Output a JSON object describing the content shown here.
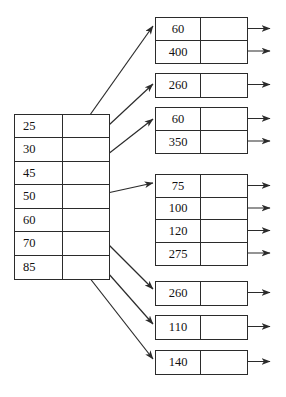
{
  "diagram": {
    "stroke_color": "#2b2b2b",
    "text_color": "#111111",
    "background": "#ffffff"
  },
  "index_table": {
    "name": "index-table",
    "geometry": {
      "x": 14,
      "y": 114,
      "width": 96,
      "height": 166,
      "divider_x": 48
    },
    "rows": [
      {
        "key": "25",
        "pointer": ""
      },
      {
        "key": "30",
        "pointer": ""
      },
      {
        "key": "45",
        "pointer": ""
      },
      {
        "key": "50",
        "pointer": ""
      },
      {
        "key": "60",
        "pointer": ""
      },
      {
        "key": "70",
        "pointer": ""
      },
      {
        "key": "85",
        "pointer": ""
      }
    ]
  },
  "buckets": [
    {
      "id": "bucket-1",
      "x": 155,
      "y": 17,
      "width": 93,
      "row_height": 22.5,
      "entries": [
        "60",
        "400"
      ]
    },
    {
      "id": "bucket-2",
      "x": 155,
      "y": 73,
      "width": 93,
      "row_height": 23,
      "entries": [
        "260"
      ]
    },
    {
      "id": "bucket-3",
      "x": 155,
      "y": 107,
      "width": 93,
      "row_height": 22.5,
      "entries": [
        "60",
        "350"
      ]
    },
    {
      "id": "bucket-4",
      "x": 155,
      "y": 174,
      "width": 93,
      "row_height": 22.5,
      "entries": [
        "75",
        "100",
        "120",
        "275"
      ]
    },
    {
      "id": "bucket-5",
      "x": 155,
      "y": 281,
      "width": 93,
      "row_height": 23,
      "entries": [
        "260"
      ]
    },
    {
      "id": "bucket-6",
      "x": 155,
      "y": 315,
      "width": 93,
      "row_height": 23,
      "entries": [
        "110"
      ]
    },
    {
      "id": "bucket-7",
      "x": 155,
      "y": 350,
      "width": 93,
      "row_height": 23,
      "entries": [
        "140"
      ]
    }
  ],
  "connector_arrows": [
    {
      "from_row": "25",
      "to_bucket": "bucket-1",
      "x1": 80,
      "y1": 129,
      "x2": 153,
      "y2": 26
    },
    {
      "from_row": "30",
      "to_bucket": "bucket-2",
      "x1": 80,
      "y1": 152,
      "x2": 153,
      "y2": 84
    },
    {
      "from_row": "45",
      "to_bucket": "bucket-3",
      "x1": 80,
      "y1": 176,
      "x2": 153,
      "y2": 119
    },
    {
      "from_row": "50",
      "to_bucket": "bucket-4",
      "x1": 80,
      "y1": 199,
      "x2": 153,
      "y2": 183
    },
    {
      "from_row": "60",
      "to_bucket": "bucket-5",
      "x1": 78,
      "y1": 214,
      "x2": 153,
      "y2": 289
    },
    {
      "from_row": "70",
      "to_bucket": "bucket-6",
      "x1": 78,
      "y1": 239,
      "x2": 153,
      "y2": 324
    },
    {
      "from_row": "85",
      "to_bucket": "bucket-7",
      "x1": 78,
      "y1": 263,
      "x2": 153,
      "y2": 359
    }
  ],
  "outgoing_arrows": [
    {
      "bucket": "bucket-1",
      "entry": "60",
      "y": 28.5
    },
    {
      "bucket": "bucket-1",
      "entry": "400",
      "y": 51
    },
    {
      "bucket": "bucket-2",
      "entry": "260",
      "y": 84.5
    },
    {
      "bucket": "bucket-3",
      "entry": "60",
      "y": 118.5
    },
    {
      "bucket": "bucket-3",
      "entry": "350",
      "y": 141
    },
    {
      "bucket": "bucket-4",
      "entry": "75",
      "y": 185.5
    },
    {
      "bucket": "bucket-4",
      "entry": "100",
      "y": 208
    },
    {
      "bucket": "bucket-4",
      "entry": "120",
      "y": 230.5
    },
    {
      "bucket": "bucket-4",
      "entry": "275",
      "y": 253
    },
    {
      "bucket": "bucket-5",
      "entry": "260",
      "y": 292.5
    },
    {
      "bucket": "bucket-6",
      "entry": "110",
      "y": 326.5
    },
    {
      "bucket": "bucket-7",
      "entry": "140",
      "y": 361.5
    }
  ],
  "arrow_geometry": {
    "out_start_x": 222,
    "out_end_x": 270
  }
}
